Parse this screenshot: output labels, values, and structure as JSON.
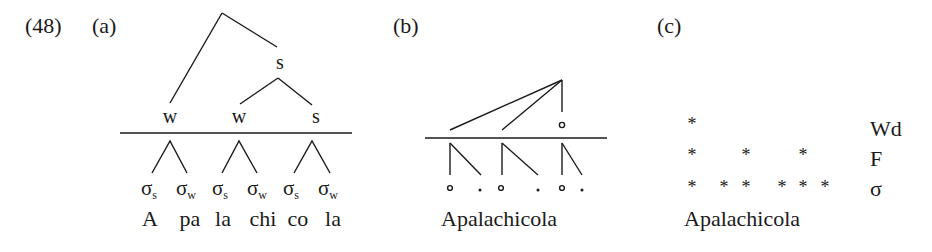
{
  "example_number": "(48)",
  "panels": {
    "a": {
      "label": "(a)",
      "root_label": "s",
      "foot_labels": [
        "w",
        "w",
        "s"
      ],
      "syllable_symbol": "σ",
      "syllable_subscripts": [
        "s",
        "w",
        "s",
        "w",
        "s",
        "w"
      ],
      "syllables": [
        "A",
        "pa",
        "la",
        "chi",
        "co",
        "la"
      ]
    },
    "b": {
      "label": "(b)",
      "word": "Apalachicola",
      "head_marker": "∘",
      "strong_marker": "∘",
      "weak_marker": "."
    },
    "c": {
      "label": "(c)",
      "word": "Apalachicola",
      "grid_mark": "*",
      "row_labels": [
        "Wd",
        "F",
        "σ"
      ],
      "grid": {
        "Wd": [
          1,
          0,
          0,
          0,
          0,
          0
        ],
        "F": [
          1,
          0,
          1,
          0,
          1,
          0
        ],
        "σ": [
          1,
          1,
          1,
          1,
          1,
          1
        ]
      }
    }
  },
  "colors": {
    "ink": "#1a1a1a",
    "background": "#ffffff"
  }
}
